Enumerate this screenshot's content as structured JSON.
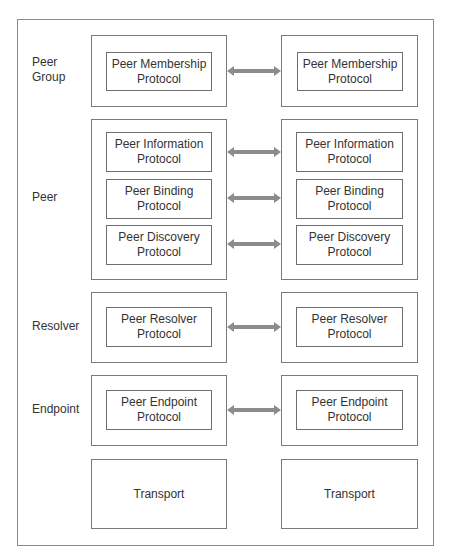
{
  "diagram": {
    "layers": [
      {
        "label_line1": "Peer",
        "label_line2": "Group",
        "protocols": [
          {
            "line1": "Peer Membership",
            "line2": "Protocol"
          }
        ]
      },
      {
        "label_line1": "Peer",
        "label_line2": "",
        "protocols": [
          {
            "line1": "Peer Information",
            "line2": "Protocol"
          },
          {
            "line1": "Peer Binding",
            "line2": "Protocol"
          },
          {
            "line1": "Peer Discovery",
            "line2": "Protocol"
          }
        ]
      },
      {
        "label_line1": "Resolver",
        "label_line2": "",
        "protocols": [
          {
            "line1": "Peer Resolver",
            "line2": "Protocol"
          }
        ]
      },
      {
        "label_line1": "Endpoint",
        "label_line2": "",
        "protocols": [
          {
            "line1": "Peer Endpoint",
            "line2": "Protocol"
          }
        ]
      }
    ],
    "transport_left": "Transport",
    "transport_right": "Transport",
    "colors": {
      "arrow": "#8c8c8c",
      "border": "#7a7a7a",
      "text": "#333333"
    }
  }
}
